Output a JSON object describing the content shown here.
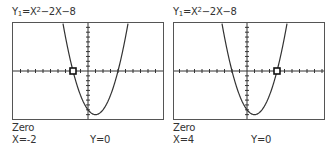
{
  "screens": [
    {
      "equation": {
        "prefix": "Y",
        "sub": "1",
        "mid": "=X",
        "sup": "2",
        "rest": "−2X−8"
      },
      "mode_label": "Zero",
      "x_readout": "X=-2",
      "y_readout": "Y=0",
      "cursor_x": -2
    },
    {
      "equation": {
        "prefix": "Y",
        "sub": "1",
        "mid": "=X",
        "sup": "2",
        "rest": "−2X−8"
      },
      "mode_label": "Zero",
      "x_readout": "X=4",
      "y_readout": "Y=0",
      "cursor_x": 4
    }
  ],
  "colors": {
    "frame": "#555555",
    "curve": "#333333",
    "text": "#333333"
  }
}
